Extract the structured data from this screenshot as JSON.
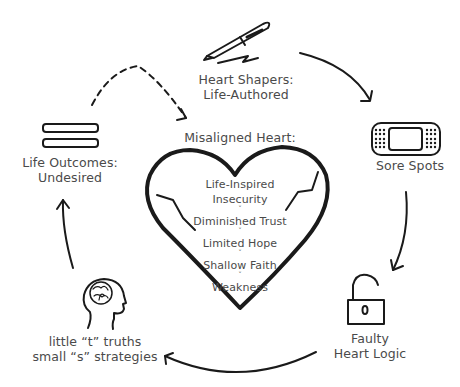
{
  "colors": {
    "stroke": "#1a1a1a",
    "text": "#4a4a4a",
    "background": "#ffffff"
  },
  "nodes": {
    "heart_shapers": {
      "icon": "pen-icon",
      "line1": "Heart Shapers:",
      "line2": "Life-Authored"
    },
    "sore_spots": {
      "icon": "bandage-icon",
      "line1": "Sore Spots"
    },
    "faulty_logic": {
      "icon": "unlocked-padlock-icon",
      "line1": "Faulty",
      "line2": "Heart Logic"
    },
    "little_truths": {
      "icon": "head-brain-icon",
      "line1": "little “t” truths",
      "line2": "small “s” strategies"
    },
    "life_outcomes": {
      "icon": "equals-bars-icon",
      "line1": "Life Outcomes:",
      "line2": "Undesired"
    }
  },
  "heart": {
    "title": "Misaligned Heart:",
    "icon": "cracked-heart-icon",
    "chevron": "˅",
    "items": [
      "Life-Inspired",
      "Insecurity",
      "Diminished Trust",
      "Limited Hope",
      "Shallow Faith",
      "Weakness"
    ]
  },
  "edges": [
    {
      "from": "heart_shapers",
      "to": "sore_spots",
      "style": "solid"
    },
    {
      "from": "sore_spots",
      "to": "faulty_logic",
      "style": "solid"
    },
    {
      "from": "faulty_logic",
      "to": "little_truths",
      "style": "solid"
    },
    {
      "from": "little_truths",
      "to": "life_outcomes",
      "style": "solid"
    },
    {
      "from": "life_outcomes",
      "to": "heart",
      "style": "dashed"
    }
  ]
}
